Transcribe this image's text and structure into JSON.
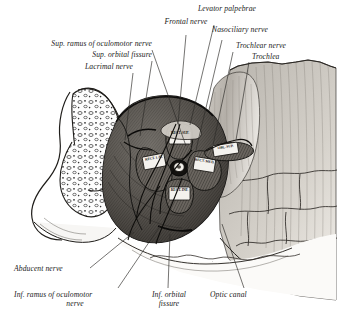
{
  "figure": {
    "kind": "anatomical-engraving",
    "background_color": "#ffffff",
    "ink_color": "#1a1a1a"
  },
  "labels": {
    "frontal_nerve": "Frontal nerve",
    "levator_palpebrae": "Levator palpebrae",
    "nasociliary_nerve": "Nasociliary nerve",
    "trochlear_nerve": "Trochlear nerve",
    "trochlea": "Trochlea",
    "sup_ramus_oculomotor": "Sup. ramus of oculomotor nerve",
    "sup_orbital_fissure": "Sup. orbital fissure",
    "lacrimal_nerve": "Lacrimal nerve",
    "abducent_nerve": "Abducent nerve",
    "inf_ramus_oculomotor_line1": "Inf. ramus of oculomotor",
    "inf_ramus_oculomotor_line2": "nerve",
    "inf_orbital_fissure_line1": "Inf. orbital",
    "inf_orbital_fissure_line2": "fissure",
    "optic_canal": "Optic canal"
  },
  "muscle_labels": {
    "rectus_superior": "RECT. SUP.",
    "rectus_lateralis": "RECT. LAT.",
    "rectus_medialis": "RECT. MED.",
    "rectus_inferior": "RECT. INF.",
    "obliquus_superior": "OBL. SUP."
  }
}
